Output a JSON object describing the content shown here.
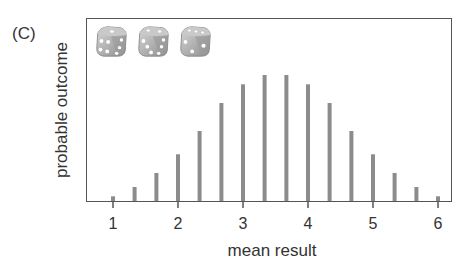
{
  "panel_label": "(C)",
  "dice": {
    "count": 3,
    "icons": [
      "die-icon",
      "die-icon",
      "die-icon"
    ],
    "faces": [
      {
        "front": 4,
        "top": 1,
        "side": 3
      },
      {
        "front": 3,
        "top": 2,
        "side": 3
      },
      {
        "front": 2,
        "top": 3,
        "side": 1
      }
    ]
  },
  "colors": {
    "bar": "#8c8c8c",
    "axis": "#555555",
    "text": "#333333"
  },
  "chart_data": {
    "type": "bar",
    "title": "",
    "xlabel": "mean result",
    "ylabel": "probable outcome",
    "x": [
      1.0,
      1.333,
      1.667,
      2.0,
      2.333,
      2.667,
      3.0,
      3.333,
      3.667,
      4.0,
      4.333,
      4.667,
      5.0,
      5.333,
      5.667,
      6.0
    ],
    "values": [
      1,
      3,
      6,
      10,
      15,
      21,
      25,
      27,
      27,
      25,
      21,
      15,
      10,
      6,
      3,
      1
    ],
    "xticks": [
      1,
      2,
      3,
      4,
      5,
      6
    ],
    "xtick_labels": [
      "1",
      "2",
      "3",
      "4",
      "5",
      "6"
    ],
    "xlim": [
      0.6,
      6.2
    ],
    "ylim": [
      0,
      38
    ],
    "yticks": [],
    "grid": false,
    "legend": null
  }
}
